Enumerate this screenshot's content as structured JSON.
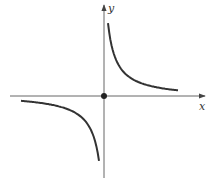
{
  "chart_data": {
    "type": "line",
    "title": "",
    "function": "y = k/x (hyperbola)",
    "xlabel": "x",
    "ylabel": "y",
    "grid": false,
    "legend": null,
    "tick_labels": [],
    "series": [
      {
        "name": "upper-right branch",
        "quadrant": "I",
        "x_range_px": [
          108,
          178
        ]
      },
      {
        "name": "lower-left branch",
        "quadrant": "III",
        "x_range_px": [
          21,
          99
        ]
      }
    ],
    "annotations": [
      {
        "type": "point",
        "label": "origin",
        "x": 0,
        "y": 0
      }
    ]
  },
  "axes": {
    "x_label": "x",
    "y_label": "y"
  },
  "colors": {
    "curve": "#333333",
    "axis": "#555555",
    "background": "#ffffff"
  }
}
